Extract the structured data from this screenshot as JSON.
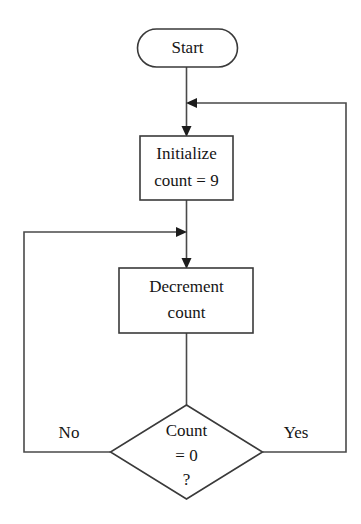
{
  "diagram": {
    "type": "flowchart",
    "canvas": {
      "width": 361,
      "height": 524
    },
    "colors": {
      "background": "#ffffff",
      "shape_stroke": "#3a3a3a",
      "shape_fill": "#ffffff",
      "connector_stroke": "#4a4a4a",
      "arrow_fill": "#1c1c1c",
      "text": "#151515"
    },
    "nodes": [
      {
        "id": "start",
        "shape": "terminator",
        "label_lines": [
          "Start"
        ],
        "x": 137.5,
        "y": 29,
        "width": 100,
        "height": 38,
        "rx": 19
      },
      {
        "id": "initialize",
        "shape": "process",
        "label_lines": [
          "Initialize",
          "count = 9"
        ],
        "x": 140,
        "y": 136,
        "width": 93,
        "height": 64,
        "rx": 0
      },
      {
        "id": "decrement",
        "shape": "process",
        "label_lines": [
          "Decrement",
          "count"
        ],
        "x": 119,
        "y": 268,
        "width": 134,
        "height": 65,
        "rx": 0
      },
      {
        "id": "decision",
        "shape": "decision",
        "label_lines": [
          "Count",
          "= 0",
          "?"
        ],
        "cx": 186.5,
        "cy": 452,
        "half_width": 76,
        "half_height": 47
      }
    ],
    "edges": [
      {
        "id": "start-to-initialize",
        "from": "start",
        "to": "initialize",
        "label": "",
        "points": "186.5,67 186.5,136",
        "arrow": {
          "x": 186.5,
          "y": 136,
          "dir": "down"
        }
      },
      {
        "id": "yes-loop-to-initialize",
        "from": "decision",
        "to": "initialize",
        "label": "Yes",
        "label_x": 296,
        "label_y": 433,
        "points": "262.5,452 346,452 346,103 188,103",
        "arrow": {
          "x": 188,
          "y": 103,
          "dir": "left"
        }
      },
      {
        "id": "initialize-to-decrement",
        "from": "initialize",
        "to": "decrement",
        "label": "",
        "points": "186.5,200 186.5,268",
        "arrow": {
          "x": 186.5,
          "y": 268,
          "dir": "down"
        }
      },
      {
        "id": "no-loop-to-decrement",
        "from": "decision",
        "to": "decrement",
        "label": "No",
        "label_x": 69,
        "label_y": 433,
        "points": "110.5,452 24,452 24,232 185,232",
        "arrow": {
          "x": 185,
          "y": 232,
          "dir": "right"
        }
      },
      {
        "id": "decrement-to-decision",
        "from": "decrement",
        "to": "decision",
        "label": "",
        "points": "186.5,333 186.5,405",
        "arrow": null
      }
    ],
    "labels": {
      "start": "Start",
      "initialize_line1": "Initialize",
      "initialize_line2": "count = 9",
      "decrement_line1": "Decrement",
      "decrement_line2": "count",
      "decision_line1": "Count",
      "decision_line2": "= 0",
      "decision_line3": "?",
      "edge_yes": "Yes",
      "edge_no": "No"
    }
  }
}
